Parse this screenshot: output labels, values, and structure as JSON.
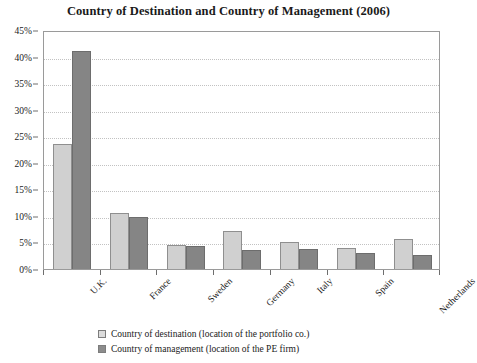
{
  "chart_data": {
    "type": "bar",
    "title": "Country of Destination and Country of Management (2006)",
    "xlabel": "",
    "ylabel": "",
    "ylim": [
      0,
      45
    ],
    "ytick_step": 5,
    "grid": true,
    "legend_position": "bottom",
    "categories": [
      "U.K.",
      "France",
      "Sweden",
      "Germany",
      "Italy",
      "Spain",
      "Netherlands"
    ],
    "ytick_labels": [
      "0%",
      "5%",
      "10%",
      "15%",
      "20%",
      "25%",
      "30%",
      "35%",
      "40%",
      "45%"
    ],
    "ytick_values": [
      0,
      5,
      10,
      15,
      20,
      25,
      30,
      35,
      40,
      45
    ],
    "series": [
      {
        "name": "Country of destination (location of the portfolio co.)",
        "color": "#d0d0d0",
        "values": [
          23.5,
          10.6,
          4.5,
          7.2,
          5.1,
          4.0,
          5.7
        ]
      },
      {
        "name": "Country of management (location of the PE firm)",
        "color": "#858585",
        "values": [
          41.0,
          9.8,
          4.4,
          3.6,
          3.7,
          3.1,
          2.7
        ]
      }
    ]
  }
}
